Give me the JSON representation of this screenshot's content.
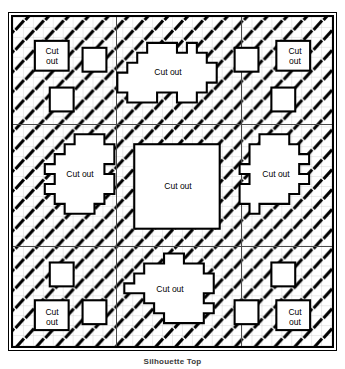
{
  "figure": {
    "caption": "Silhouette Top",
    "plate": {
      "label": "hatched-material-plate",
      "border_color": "#000000",
      "fill_color": "#ffffff"
    },
    "hatch": {
      "name": "diagonal-slash-hatch",
      "mark_color": "#000000",
      "grid_color": "#bfbfbf",
      "cell_size": 10,
      "angle_deg": -40
    },
    "dividers": {
      "color": "#4a4a4a",
      "vertical_x": [
        103,
        228
      ],
      "horizontal_y": [
        107,
        229
      ]
    },
    "cutouts": [
      {
        "id": "top-left-square-large",
        "label": "Cut\nout",
        "shape": "square",
        "x": 30,
        "y": 36,
        "w": 34,
        "h": 30
      },
      {
        "id": "top-left-square-small-a",
        "label": "",
        "shape": "square",
        "x": 78,
        "y": 43,
        "w": 24,
        "h": 24
      },
      {
        "id": "top-left-square-small-b",
        "label": "",
        "shape": "square",
        "x": 45,
        "y": 83,
        "w": 24,
        "h": 24
      },
      {
        "id": "top-center-polygon",
        "label": "Cut out",
        "shape": "stepped-polygon",
        "x": 113,
        "y": 38,
        "w": 100,
        "h": 68
      },
      {
        "id": "top-right-square-small-a",
        "label": "",
        "shape": "square",
        "x": 231,
        "y": 43,
        "w": 24,
        "h": 24
      },
      {
        "id": "top-right-square-large",
        "label": "Cut\nout",
        "shape": "square",
        "x": 273,
        "y": 36,
        "w": 34,
        "h": 30
      },
      {
        "id": "top-right-square-small-b",
        "label": "",
        "shape": "square",
        "x": 268,
        "y": 83,
        "w": 24,
        "h": 24
      },
      {
        "id": "middle-left-polygon",
        "label": "Cut out",
        "shape": "stepped-polygon",
        "x": 30,
        "y": 140,
        "w": 75,
        "h": 85
      },
      {
        "id": "center-square-large",
        "label": "Cut out",
        "shape": "square",
        "x": 130,
        "y": 140,
        "w": 86,
        "h": 85
      },
      {
        "id": "middle-right-polygon",
        "label": "Cut out",
        "shape": "stepped-polygon",
        "x": 240,
        "y": 140,
        "w": 75,
        "h": 85
      },
      {
        "id": "bottom-left-square-small-a",
        "label": "",
        "shape": "square",
        "x": 45,
        "y": 259,
        "w": 24,
        "h": 24
      },
      {
        "id": "bottom-left-square-large",
        "label": "Cut\nout",
        "shape": "square",
        "x": 30,
        "y": 297,
        "w": 34,
        "h": 30
      },
      {
        "id": "bottom-left-square-small-b",
        "label": "",
        "shape": "square",
        "x": 78,
        "y": 297,
        "w": 24,
        "h": 24
      },
      {
        "id": "bottom-center-polygon",
        "label": "Cut out",
        "shape": "stepped-polygon",
        "x": 120,
        "y": 258,
        "w": 95,
        "h": 70
      },
      {
        "id": "bottom-right-square-small-a",
        "label": "",
        "shape": "square",
        "x": 268,
        "y": 259,
        "w": 24,
        "h": 24
      },
      {
        "id": "bottom-right-square-small-b",
        "label": "",
        "shape": "square",
        "x": 231,
        "y": 297,
        "w": 24,
        "h": 24
      },
      {
        "id": "bottom-right-square-large",
        "label": "Cut\nout",
        "shape": "square",
        "x": 273,
        "y": 297,
        "w": 34,
        "h": 30
      }
    ],
    "labels": {
      "cut_out_two_line": "Cut\nout",
      "cut_out_one_line": "Cut out"
    }
  }
}
